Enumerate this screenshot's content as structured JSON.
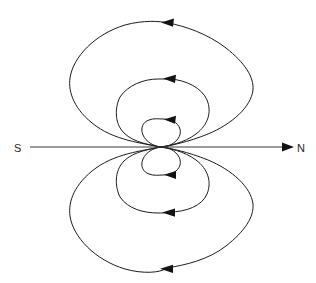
{
  "diagram": {
    "type": "field-line-diagram",
    "background_color": "#ffffff",
    "line_color": "#1c1c1c",
    "axis_color": "#3a3a3a",
    "arrow_color": "#121212",
    "labels": {
      "south_pole": "S",
      "north_pole": "N"
    },
    "axis": {
      "name": "dipole-axis",
      "start_x": 30,
      "end_x": 294,
      "y": 147,
      "arrow_direction": "right",
      "arrow_tip_x": 294
    },
    "dipole_center": {
      "x": 160,
      "y": 147
    },
    "loops": [
      {
        "name": "inner-loop",
        "index": 1,
        "half_width": 21,
        "top_y": 119,
        "bottom_y": 175,
        "arrow_direction": "left"
      },
      {
        "name": "middle-loop",
        "index": 2,
        "half_width": 46,
        "top_y": 79,
        "bottom_y": 213,
        "arrow_direction": "left"
      },
      {
        "name": "outer-loop",
        "index": 3,
        "half_width": 92,
        "top_y": 22,
        "bottom_y": 268,
        "arrow_direction": "left"
      }
    ],
    "arrows": [
      {
        "name": "inner-top-arrow",
        "x": 171,
        "y": 119,
        "direction": "left"
      },
      {
        "name": "middle-top-arrow",
        "x": 170,
        "y": 79,
        "direction": "left"
      },
      {
        "name": "outer-top-arrow",
        "x": 168,
        "y": 23,
        "direction": "left"
      },
      {
        "name": "inner-bottom-arrow",
        "x": 171,
        "y": 174,
        "direction": "left"
      },
      {
        "name": "middle-bottom-arrow",
        "x": 169,
        "y": 212,
        "direction": "left"
      },
      {
        "name": "outer-bottom-arrow",
        "x": 167,
        "y": 268,
        "direction": "left"
      }
    ]
  }
}
